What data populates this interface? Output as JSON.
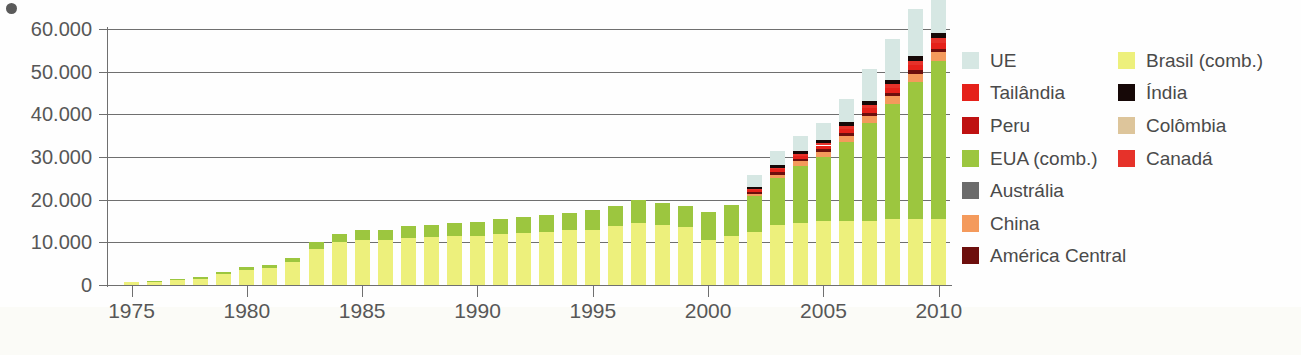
{
  "figure": {
    "background": "#fefefe",
    "axis_color": "#6f6f6f",
    "text_color": "#575757"
  },
  "legend": {
    "columns": [
      {
        "items": [
          {
            "label": "UE",
            "color": "#d6e7e3"
          },
          {
            "label": "Tailândia",
            "color": "#e5211a"
          },
          {
            "label": "Peru",
            "color": "#bf1111"
          },
          {
            "label": "EUA (comb.)",
            "color": "#9cc63f"
          },
          {
            "label": "Austrália",
            "color": "#6b6b6b"
          },
          {
            "label": "China",
            "color": "#f49a5c"
          },
          {
            "label": "América Central",
            "color": "#6d0f0d"
          }
        ]
      },
      {
        "items": [
          {
            "label": "Brasil (comb.)",
            "color": "#edf07c"
          },
          {
            "label": "Índia",
            "color": "#160807"
          },
          {
            "label": "Colômbia",
            "color": "#ddc59b"
          },
          {
            "label": "Canadá",
            "color": "#e6322a"
          }
        ]
      }
    ]
  },
  "chart_data": {
    "type": "bar",
    "stacked": true,
    "title": "",
    "subtitle": "",
    "xlabel": "",
    "ylabel": "",
    "grid": true,
    "legend_position": "right",
    "ylim": [
      0,
      60000
    ],
    "yticks": [
      0,
      10000,
      20000,
      30000,
      40000,
      50000,
      60000
    ],
    "ytick_labels": [
      "0",
      "10.000",
      "20.000",
      "30.000",
      "40.000",
      "50.000",
      "60.000"
    ],
    "xlim": [
      1975,
      2010
    ],
    "xticks": [
      1975,
      1980,
      1985,
      1990,
      1995,
      2000,
      2005,
      2010
    ],
    "xtick_labels": [
      "1975",
      "1980",
      "1985",
      "1990",
      "1995",
      "2000",
      "2005",
      "2010"
    ],
    "x": [
      1975,
      1976,
      1977,
      1978,
      1979,
      1980,
      1981,
      1982,
      1983,
      1984,
      1985,
      1986,
      1987,
      1988,
      1989,
      1990,
      1991,
      1992,
      1993,
      1994,
      1995,
      1996,
      1997,
      1998,
      1999,
      2000,
      2001,
      2002,
      2003,
      2004,
      2005,
      2006,
      2007,
      2008,
      2009,
      2010
    ],
    "categories": [
      "1975",
      "1976",
      "1977",
      "1978",
      "1979",
      "1980",
      "1981",
      "1982",
      "1983",
      "1984",
      "1985",
      "1986",
      "1987",
      "1988",
      "1989",
      "1990",
      "1991",
      "1992",
      "1993",
      "1994",
      "1995",
      "1996",
      "1997",
      "1998",
      "1999",
      "2000",
      "2001",
      "2002",
      "2003",
      "2004",
      "2005",
      "2006",
      "2007",
      "2008",
      "2009",
      "2010"
    ],
    "series": [
      {
        "name": "Brasil (comb.)",
        "color": "#edf07c",
        "values": [
          600,
          700,
          1200,
          1500,
          2600,
          3500,
          4000,
          5500,
          8500,
          10000,
          10500,
          10500,
          11000,
          11200,
          11500,
          11500,
          12000,
          12200,
          12500,
          12800,
          13000,
          13800,
          14500,
          14000,
          13500,
          10500,
          11500,
          12500,
          14000,
          14500,
          15000,
          15000,
          15000,
          15500,
          15500,
          15500
        ]
      },
      {
        "name": "EUA (comb.)",
        "color": "#9cc63f",
        "values": [
          0,
          100,
          300,
          400,
          500,
          700,
          800,
          900,
          1500,
          2000,
          2500,
          2500,
          2800,
          2900,
          3000,
          3200,
          3500,
          3700,
          3800,
          4000,
          4500,
          4700,
          5500,
          5200,
          5000,
          6500,
          7200,
          8300,
          11000,
          13500,
          15000,
          18500,
          23000,
          27000,
          32000,
          37000
        ]
      },
      {
        "name": "China",
        "color": "#f49a5c",
        "values": [
          0,
          0,
          0,
          0,
          0,
          0,
          0,
          0,
          0,
          0,
          0,
          0,
          0,
          0,
          0,
          0,
          0,
          0,
          0,
          0,
          0,
          0,
          0,
          0,
          0,
          0,
          0,
          600,
          900,
          1000,
          1200,
          1500,
          1600,
          1800,
          2000,
          2100
        ]
      },
      {
        "name": "América Central",
        "color": "#6d0f0d",
        "values": [
          0,
          0,
          0,
          0,
          0,
          0,
          0,
          0,
          0,
          0,
          0,
          0,
          0,
          0,
          0,
          0,
          0,
          0,
          0,
          0,
          0,
          0,
          0,
          0,
          0,
          0,
          0,
          400,
          500,
          500,
          600,
          600,
          700,
          700,
          800,
          800
        ]
      },
      {
        "name": "Tailândia",
        "color": "#e5211a",
        "values": [
          0,
          0,
          0,
          0,
          0,
          0,
          0,
          0,
          0,
          0,
          0,
          0,
          0,
          0,
          0,
          0,
          0,
          0,
          0,
          0,
          0,
          0,
          0,
          0,
          0,
          0,
          0,
          500,
          700,
          800,
          900,
          1000,
          1100,
          1200,
          1300,
          1400
        ]
      },
      {
        "name": "Canadá",
        "color": "#e6322a",
        "values": [
          0,
          0,
          0,
          0,
          0,
          0,
          0,
          0,
          0,
          0,
          0,
          0,
          0,
          0,
          0,
          0,
          0,
          0,
          0,
          0,
          0,
          0,
          0,
          0,
          0,
          0,
          0,
          300,
          400,
          400,
          500,
          600,
          700,
          800,
          900,
          1000
        ]
      },
      {
        "name": "Índia",
        "color": "#160807",
        "values": [
          0,
          0,
          0,
          0,
          0,
          0,
          0,
          0,
          0,
          0,
          0,
          0,
          0,
          0,
          0,
          0,
          0,
          0,
          0,
          0,
          0,
          0,
          0,
          0,
          0,
          0,
          0,
          400,
          600,
          700,
          800,
          900,
          1000,
          1100,
          1200,
          1300
        ]
      },
      {
        "name": "UE",
        "color": "#d6e7e3",
        "values": [
          0,
          0,
          0,
          0,
          0,
          0,
          0,
          0,
          0,
          0,
          0,
          0,
          0,
          0,
          0,
          0,
          0,
          0,
          0,
          0,
          0,
          0,
          0,
          0,
          0,
          0,
          0,
          2800,
          3400,
          3600,
          4000,
          5500,
          7500,
          9500,
          11000,
          12000
        ]
      }
    ],
    "totals": [
      600,
      800,
      1500,
      1900,
      3100,
      4200,
      4800,
      6400,
      10000,
      12000,
      13000,
      13000,
      13800,
      14100,
      14500,
      14700,
      15500,
      15900,
      16300,
      16800,
      17500,
      18500,
      20000,
      19200,
      18500,
      17000,
      18700,
      25800,
      28400,
      30500,
      33000,
      36500,
      40600,
      44600,
      49700,
      55700
    ]
  }
}
